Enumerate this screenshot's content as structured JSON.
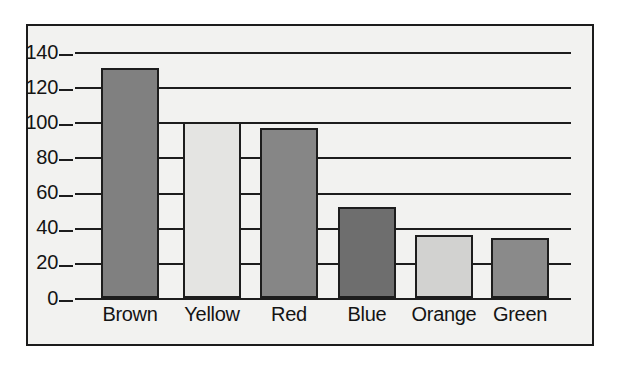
{
  "chart_data": {
    "type": "bar",
    "title": "",
    "subtitle": "",
    "xlabel": "",
    "ylabel": "",
    "categories": [
      "Brown",
      "Yellow",
      "Red",
      "Blue",
      "Orange",
      "Green"
    ],
    "values": [
      131,
      100,
      97,
      52,
      36,
      34
    ],
    "ylim": [
      0,
      140
    ],
    "ytick_labels": [
      "140",
      "120",
      "100",
      "80",
      "60",
      "40",
      "20",
      "0"
    ],
    "ytick_values": [
      140,
      120,
      100,
      80,
      60,
      40,
      20,
      0
    ],
    "grid": "horizontal",
    "legend": "none",
    "bar_colors": [
      "#808080",
      "#e4e4e2",
      "#868686",
      "#6e6e6e",
      "#d2d2d0",
      "#8a8a8a"
    ],
    "bar_border_color": "#1d1d1d",
    "axis_color": "#1d1d1d",
    "plot_background": "#f2f2f0",
    "frame_border_color": "#1c1c1c",
    "annotations": []
  }
}
